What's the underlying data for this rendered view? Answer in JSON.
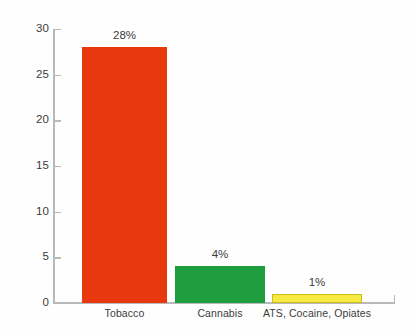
{
  "chart_data": {
    "type": "bar",
    "title": "",
    "subtitle": "",
    "xlabel": "",
    "ylabel": "",
    "categories": [
      "Tobacco",
      "Cannabis",
      "ATS, Cocaine, Opiates"
    ],
    "values": [
      28,
      4,
      1
    ],
    "data_labels": [
      "28%",
      "4%",
      "1%"
    ],
    "series": [
      {
        "name": "",
        "values": [
          28,
          4,
          1
        ]
      }
    ],
    "bar_colors": [
      "#e8380d",
      "#1f9e3f",
      "#f5e942"
    ],
    "bar_border_colors": [
      "#e8380d",
      "#1f9e3f",
      "#c9bc1e"
    ],
    "ylim": [
      0,
      30
    ],
    "yticks": [
      0,
      5,
      10,
      15,
      20,
      25,
      30
    ],
    "ytick_labels": [
      "0",
      "5",
      "10",
      "15",
      "20",
      "25",
      "30"
    ],
    "grid": false,
    "legend": false,
    "legend_position": "none",
    "axis_color": "#b9b9b9",
    "text_color": "#3b3b3b",
    "background_color": "#fefefe"
  }
}
